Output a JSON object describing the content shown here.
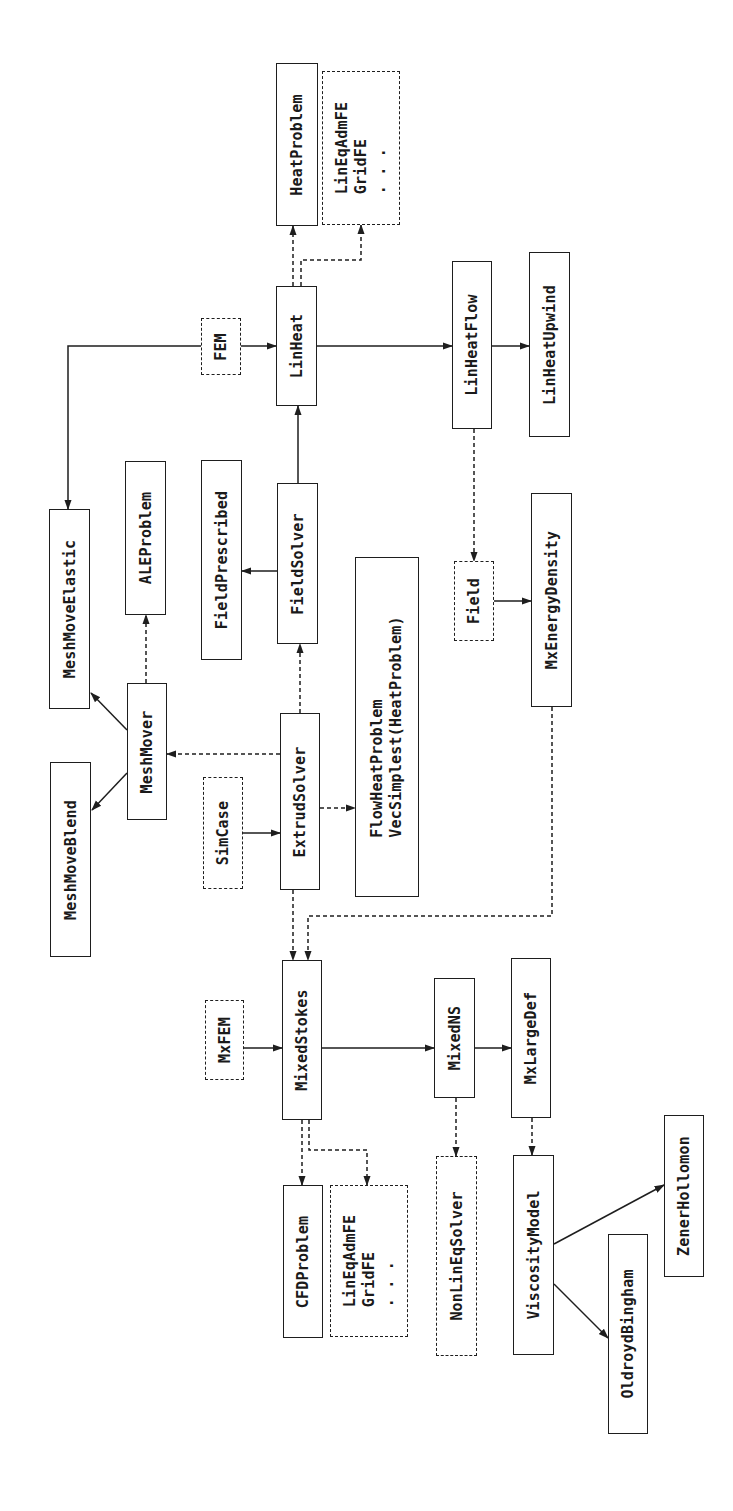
{
  "diagram": {
    "title": "",
    "orientation": "rotated-90-ccw",
    "colors": {
      "line": "#1e1e1e",
      "background": "#ffffff"
    },
    "nodes": [
      {
        "id": "HeatProblem",
        "label": "HeatProblem",
        "style": "solid",
        "x": 276,
        "y": 63,
        "w": 42,
        "h": 163
      },
      {
        "id": "LinEqAdmFE_1",
        "label": "LinEqAdmFE\nGridFE\n. . .",
        "style": "dashed",
        "x": 322,
        "y": 71,
        "w": 78,
        "h": 154
      },
      {
        "id": "FEM",
        "label": "FEM",
        "style": "dashed",
        "x": 201,
        "y": 318,
        "w": 40,
        "h": 57
      },
      {
        "id": "LinHeat",
        "label": "LinHeat",
        "style": "solid",
        "x": 276,
        "y": 286,
        "w": 41,
        "h": 120
      },
      {
        "id": "LinHeatFlow",
        "label": "LinHeatFlow",
        "style": "solid",
        "x": 452,
        "y": 261,
        "w": 40,
        "h": 168
      },
      {
        "id": "LinHeatUpwind",
        "label": "LinHeatUpwind",
        "style": "solid",
        "x": 529,
        "y": 252,
        "w": 41,
        "h": 185
      },
      {
        "id": "MeshMoveElastic",
        "label": "MeshMoveElastic",
        "style": "solid",
        "x": 49,
        "y": 509,
        "w": 41,
        "h": 200
      },
      {
        "id": "ALEProblem",
        "label": "ALEProblem",
        "style": "solid",
        "x": 125,
        "y": 461,
        "w": 41,
        "h": 154
      },
      {
        "id": "FieldPrescribed",
        "label": "FieldPrescribed",
        "style": "solid",
        "x": 201,
        "y": 460,
        "w": 41,
        "h": 200
      },
      {
        "id": "FieldSolver",
        "label": "FieldSolver",
        "style": "solid",
        "x": 277,
        "y": 483,
        "w": 41,
        "h": 161
      },
      {
        "id": "FlowHeatProblem",
        "label": "FlowHeatProblem\nVecSimplest(HeatProblem)",
        "style": "solid",
        "x": 355,
        "y": 557,
        "w": 64,
        "h": 340
      },
      {
        "id": "Field",
        "label": "Field",
        "style": "dashed",
        "x": 454,
        "y": 561,
        "w": 40,
        "h": 80
      },
      {
        "id": "MxEnergyDensity",
        "label": "MxEnergyDensity",
        "style": "solid",
        "x": 531,
        "y": 493,
        "w": 41,
        "h": 214
      },
      {
        "id": "MeshMover",
        "label": "MeshMover",
        "style": "solid",
        "x": 127,
        "y": 683,
        "w": 40,
        "h": 137
      },
      {
        "id": "MeshMoveBlend",
        "label": "MeshMoveBlend",
        "style": "solid",
        "x": 50,
        "y": 762,
        "w": 41,
        "h": 195
      },
      {
        "id": "SimCase",
        "label": "SimCase",
        "style": "dashed",
        "x": 203,
        "y": 777,
        "w": 40,
        "h": 112
      },
      {
        "id": "ExtrudSolver",
        "label": "ExtrudSolver",
        "style": "solid",
        "x": 280,
        "y": 713,
        "w": 40,
        "h": 177
      },
      {
        "id": "MxFEM",
        "label": "MxFEM",
        "style": "dashed",
        "x": 205,
        "y": 1000,
        "w": 39,
        "h": 80
      },
      {
        "id": "MixedStokes",
        "label": "MixedStokes",
        "style": "solid",
        "x": 282,
        "y": 960,
        "w": 40,
        "h": 160
      },
      {
        "id": "MixedNS",
        "label": "MixedNS",
        "style": "solid",
        "x": 434,
        "y": 978,
        "w": 41,
        "h": 120
      },
      {
        "id": "MxLargeDef",
        "label": "MxLargeDef",
        "style": "solid",
        "x": 511,
        "y": 958,
        "w": 40,
        "h": 160
      },
      {
        "id": "CFDProblem",
        "label": "CFDProblem",
        "style": "solid",
        "x": 283,
        "y": 1185,
        "w": 40,
        "h": 153
      },
      {
        "id": "LinEqAdmFE_2",
        "label": "LinEqAdmFE\nGridFE\n. . .",
        "style": "dashed",
        "x": 330,
        "y": 1185,
        "w": 78,
        "h": 152
      },
      {
        "id": "NonLinEqSolver",
        "label": "NonLinEqSolver",
        "style": "dashed",
        "x": 436,
        "y": 1156,
        "w": 41,
        "h": 200
      },
      {
        "id": "ViscosityModel",
        "label": "ViscosityModel",
        "style": "solid",
        "x": 513,
        "y": 1155,
        "w": 41,
        "h": 200
      },
      {
        "id": "OldroydBingham",
        "label": "OldroydBingham",
        "style": "solid",
        "x": 608,
        "y": 1234,
        "w": 40,
        "h": 200
      },
      {
        "id": "ZenerHollomon",
        "label": "ZenerHollomon",
        "style": "solid",
        "x": 664,
        "y": 1115,
        "w": 40,
        "h": 162
      }
    ],
    "edges": [
      {
        "from": "LinHeat",
        "to": "HeatProblem",
        "style": "dashed",
        "points": [
          [
            293,
            286
          ],
          [
            293,
            226
          ]
        ]
      },
      {
        "from": "LinHeat",
        "to": "LinEqAdmFE_1",
        "style": "dashed",
        "points": [
          [
            301,
            286
          ],
          [
            301,
            260
          ],
          [
            361,
            260
          ],
          [
            361,
            225
          ]
        ]
      },
      {
        "from": "FEM",
        "to": "LinHeat",
        "style": "solid",
        "points": [
          [
            241,
            346
          ],
          [
            276,
            346
          ]
        ]
      },
      {
        "from": "FEM",
        "to": "MeshMoveElastic",
        "style": "solid",
        "points": [
          [
            201,
            346
          ],
          [
            68,
            346
          ],
          [
            68,
            509
          ]
        ]
      },
      {
        "from": "LinHeat",
        "to": "LinHeatFlow",
        "style": "solid",
        "points": [
          [
            317,
            346
          ],
          [
            452,
            346
          ]
        ]
      },
      {
        "from": "LinHeatFlow",
        "to": "LinHeatUpwind",
        "style": "solid",
        "points": [
          [
            492,
            346
          ],
          [
            529,
            346
          ]
        ]
      },
      {
        "from": "FieldSolver",
        "to": "LinHeat",
        "style": "solid",
        "points": [
          [
            298,
            483
          ],
          [
            298,
            406
          ]
        ]
      },
      {
        "from": "FieldSolver",
        "to": "FieldPrescribed",
        "style": "solid",
        "points": [
          [
            277,
            571
          ],
          [
            242,
            571
          ]
        ]
      },
      {
        "from": "LinHeatFlow",
        "to": "Field",
        "style": "dashed",
        "points": [
          [
            474,
            429
          ],
          [
            474,
            561
          ]
        ]
      },
      {
        "from": "Field",
        "to": "MxEnergyDensity",
        "style": "solid",
        "points": [
          [
            494,
            601
          ],
          [
            531,
            601
          ]
        ]
      },
      {
        "from": "MeshMover",
        "to": "ALEProblem",
        "style": "dashed",
        "points": [
          [
            146,
            683
          ],
          [
            146,
            615
          ]
        ]
      },
      {
        "from": "MeshMover",
        "to": "MeshMoveElastic",
        "style": "solid",
        "points": [
          [
            127,
            730
          ],
          [
            91,
            693
          ]
        ]
      },
      {
        "from": "MeshMover",
        "to": "MeshMoveBlend",
        "style": "solid",
        "points": [
          [
            127,
            773
          ],
          [
            92,
            810
          ]
        ]
      },
      {
        "from": "ExtrudSolver",
        "to": "MeshMover",
        "style": "dashed",
        "points": [
          [
            280,
            754
          ],
          [
            167,
            754
          ]
        ]
      },
      {
        "from": "ExtrudSolver",
        "to": "FieldSolver",
        "style": "dashed",
        "points": [
          [
            300,
            713
          ],
          [
            300,
            644
          ]
        ]
      },
      {
        "from": "SimCase",
        "to": "ExtrudSolver",
        "style": "solid",
        "points": [
          [
            243,
            833
          ],
          [
            280,
            833
          ]
        ]
      },
      {
        "from": "ExtrudSolver",
        "to": "FlowHeatProblem",
        "style": "dashed",
        "points": [
          [
            320,
            808
          ],
          [
            355,
            808
          ]
        ]
      },
      {
        "from": "ExtrudSolver",
        "to": "MixedStokes",
        "style": "dashed",
        "points": [
          [
            293,
            890
          ],
          [
            293,
            960
          ]
        ]
      },
      {
        "from": "MxEnergyDensity",
        "to": "MixedStokes",
        "style": "dashed",
        "points": [
          [
            552,
            707
          ],
          [
            552,
            916
          ],
          [
            308,
            916
          ],
          [
            308,
            960
          ]
        ]
      },
      {
        "from": "MxFEM",
        "to": "MixedStokes",
        "style": "solid",
        "points": [
          [
            244,
            1048
          ],
          [
            282,
            1048
          ]
        ]
      },
      {
        "from": "MixedStokes",
        "to": "MixedNS",
        "style": "solid",
        "points": [
          [
            322,
            1048
          ],
          [
            434,
            1048
          ]
        ]
      },
      {
        "from": "MixedNS",
        "to": "MxLargeDef",
        "style": "solid",
        "points": [
          [
            475,
            1048
          ],
          [
            511,
            1048
          ]
        ]
      },
      {
        "from": "MixedStokes",
        "to": "CFDProblem",
        "style": "dashed",
        "points": [
          [
            302,
            1120
          ],
          [
            302,
            1185
          ]
        ]
      },
      {
        "from": "MixedStokes",
        "to": "LinEqAdmFE_2",
        "style": "dashed",
        "points": [
          [
            309,
            1120
          ],
          [
            309,
            1150
          ],
          [
            367,
            1150
          ],
          [
            367,
            1185
          ]
        ]
      },
      {
        "from": "MixedNS",
        "to": "NonLinEqSolver",
        "style": "dashed",
        "points": [
          [
            456,
            1098
          ],
          [
            456,
            1156
          ]
        ]
      },
      {
        "from": "MxLargeDef",
        "to": "ViscosityModel",
        "style": "dashed",
        "points": [
          [
            532,
            1118
          ],
          [
            532,
            1155
          ]
        ]
      },
      {
        "from": "ViscosityModel",
        "to": "ZenerHollomon",
        "style": "solid",
        "points": [
          [
            554,
            1244
          ],
          [
            664,
            1185
          ]
        ]
      },
      {
        "from": "ViscosityModel",
        "to": "OldroydBingham",
        "style": "solid",
        "points": [
          [
            554,
            1284
          ],
          [
            608,
            1338
          ]
        ]
      }
    ]
  }
}
